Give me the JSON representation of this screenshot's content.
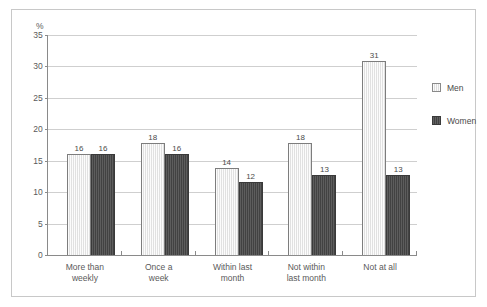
{
  "chart_data": {
    "type": "bar",
    "title": "",
    "subtitle": "",
    "xlabel": "",
    "ylabel": "%",
    "ylim": [
      0,
      35
    ],
    "yticks": [
      0,
      5,
      10,
      15,
      20,
      25,
      30,
      35
    ],
    "ytick_labels": [
      "0",
      "5",
      "10",
      "15",
      "20",
      "25",
      "30",
      "35"
    ],
    "grid": true,
    "legend_position": "right",
    "categories": [
      "More than weekly",
      "Once a week",
      "Within last month",
      "Not within last month",
      "Not at all"
    ],
    "category_lines": [
      [
        "More than",
        "weekly"
      ],
      [
        "Once a",
        "week"
      ],
      [
        "Within last",
        "month"
      ],
      [
        "Not within",
        "last month"
      ],
      [
        "Not at all"
      ]
    ],
    "series": [
      {
        "name": "Men",
        "color": "#e9e9e9",
        "values": [
          16,
          18,
          14,
          18,
          31
        ],
        "bar_heights": [
          16.0,
          17.8,
          13.8,
          17.8,
          30.9
        ],
        "labels": [
          "16",
          "18",
          "14",
          "18",
          "31"
        ]
      },
      {
        "name": "Women",
        "color": "#4b4b4b",
        "values": [
          16,
          16,
          12,
          13,
          13
        ],
        "bar_heights": [
          16.0,
          16.0,
          11.6,
          12.8,
          12.8
        ],
        "labels": [
          "16",
          "16",
          "12",
          "13",
          "13"
        ]
      }
    ]
  },
  "legend": {
    "items": [
      {
        "label": "Men"
      },
      {
        "label": "Women"
      }
    ]
  },
  "colors": {
    "men": "#e9e9e9",
    "women": "#4b4b4b",
    "gridline": "#cfcfcf",
    "axis": "#8a8a8a",
    "frame": "#c8c8c8",
    "text": "#5a5a5a"
  }
}
